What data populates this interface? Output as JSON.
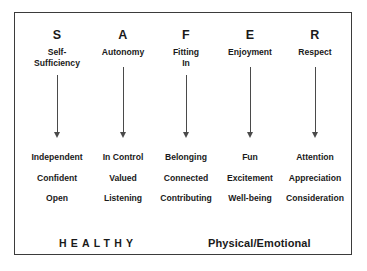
{
  "diagram": {
    "acronym": "SAFER",
    "frame_border_color": "#3b3b3b",
    "text_color": "#1a1a1a",
    "arrow_color": "#4a4a4a",
    "background_color": "#ffffff",
    "columns": [
      {
        "letter": "S",
        "title": "Self-\nSufficiency",
        "title_line1": "Self-",
        "title_line2": "Sufficiency",
        "x": 56,
        "arrow_top": 74,
        "arrow_bottom": 131,
        "values": [
          "Independent",
          "Confident",
          "Open"
        ]
      },
      {
        "letter": "A",
        "title": "Autonomy",
        "title_line1": "Autonomy",
        "title_line2": "",
        "x": 122,
        "arrow_top": 66,
        "arrow_bottom": 131,
        "values": [
          "In Control",
          "Valued",
          "Listening"
        ]
      },
      {
        "letter": "F",
        "title": "Fitting\nIn",
        "title_line1": "Fitting",
        "title_line2": "In",
        "x": 185,
        "arrow_top": 74,
        "arrow_bottom": 131,
        "values": [
          "Belonging",
          "Connected",
          "Contributing"
        ]
      },
      {
        "letter": "E",
        "title": "Enjoyment",
        "title_line1": "Enjoyment",
        "title_line2": "",
        "x": 249,
        "arrow_top": 66,
        "arrow_bottom": 131,
        "values": [
          "Fun",
          "Excitement",
          "Well-being"
        ]
      },
      {
        "letter": "R",
        "title": "Respect",
        "title_line1": "Respect",
        "title_line2": "",
        "x": 314,
        "arrow_top": 66,
        "arrow_bottom": 131,
        "values": [
          "Attention",
          "Appreciation",
          "Consideration"
        ]
      }
    ],
    "footer": {
      "left_label": "HEALTHY",
      "right_label": "Physical/Emotional"
    }
  }
}
